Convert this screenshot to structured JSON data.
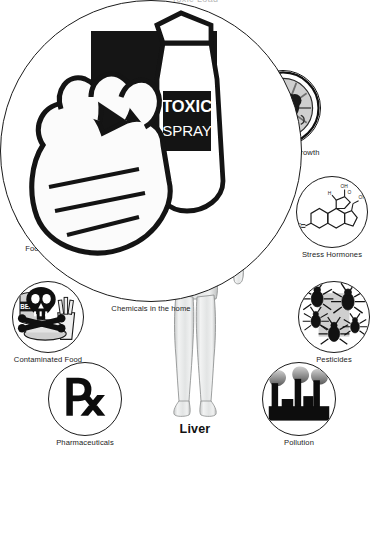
{
  "page": {
    "title_clipped": "Toxic Load",
    "background": "#ffffff",
    "center_label": "Liver",
    "ink": "#1b1b1b"
  },
  "center": {
    "organ_name": "liver",
    "figure_name": "human-body-figure",
    "organ_color": "#6e6e6e",
    "body_color": "#e8e9e9"
  },
  "nodes": [
    {
      "id": "heavy-metals",
      "label": "Heavy Metals",
      "icon": "hexagon-elements-icon",
      "elements": [
        "Pb",
        "Ni",
        "Hg",
        "Cd"
      ],
      "x": 163,
      "y": 22,
      "size": 70,
      "style": "outline"
    },
    {
      "id": "leaky-gut",
      "label": "Leaky Gut",
      "icon": "intestinal-villi-icon",
      "x": 70,
      "y": 74,
      "size": 74,
      "style": "ringed"
    },
    {
      "id": "bacterial-overgrowth",
      "label": "Bacterial Overgrowth",
      "icon": "bacteria-colony-icon",
      "x": 245,
      "y": 70,
      "size": 76,
      "style": "ringed"
    },
    {
      "id": "food-allergies",
      "label": "Food Allergies",
      "icon": "wheat-milk-cheese-corn-icon",
      "x": 14,
      "y": 170,
      "size": 72,
      "style": "outline"
    },
    {
      "id": "stress-hormones",
      "label": "Stress Hormones",
      "icon": "steroid-molecule-icon",
      "x": 296,
      "y": 176,
      "size": 72,
      "style": "outline"
    },
    {
      "id": "contaminated-food",
      "label": "Contaminated Food",
      "icon": "skull-crossbones-canned-food-icon",
      "x": 12,
      "y": 281,
      "size": 72,
      "style": "outline"
    },
    {
      "id": "pesticides",
      "label": "Pesticides",
      "icon": "insects-icon",
      "x": 298,
      "y": 281,
      "size": 72,
      "style": "outline"
    },
    {
      "id": "pharmaceuticals",
      "label": "Pharmaceuticals",
      "icon": "rx-symbol-icon",
      "x": 48,
      "y": 362,
      "size": 74,
      "style": "outline"
    },
    {
      "id": "pollution",
      "label": "Pollution",
      "icon": "factory-smokestacks-icon",
      "x": 262,
      "y": 362,
      "size": 74,
      "style": "outline"
    },
    {
      "id": "chemicals-in-the-home",
      "label": "Chemicals in the home",
      "icon": "gloved-hand-spray-bottle-icon",
      "x": 156,
      "y": 457,
      "size": 76,
      "style": "outline"
    }
  ]
}
